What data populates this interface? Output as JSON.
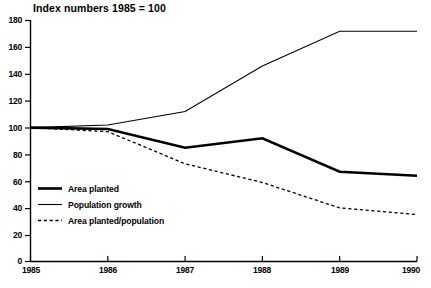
{
  "chart_data": {
    "type": "line",
    "title": "Index numbers 1985 = 100",
    "xlabel": "",
    "ylabel": "",
    "x": [
      1985,
      1986,
      1987,
      1988,
      1989,
      1990
    ],
    "xtick_labels": [
      "1985",
      "1986",
      "1987",
      "1988",
      "1989",
      "1990"
    ],
    "ytick_labels": [
      "0",
      "20",
      "40",
      "60",
      "80",
      "100",
      "120",
      "140",
      "160",
      "180"
    ],
    "yticks": [
      0,
      20,
      40,
      60,
      80,
      100,
      120,
      140,
      160,
      180
    ],
    "xlim": [
      1985,
      1990
    ],
    "ylim": [
      0,
      180
    ],
    "grid": false,
    "legend_position": "inside-lower-left",
    "series": [
      {
        "name": "Area planted",
        "style": "solid-thick",
        "color": "#000000",
        "values": [
          100,
          99,
          85,
          92,
          67,
          64
        ]
      },
      {
        "name": "Population growth",
        "style": "solid-thin",
        "color": "#000000",
        "values": [
          100,
          102,
          112,
          146,
          172,
          172
        ]
      },
      {
        "name": "Area planted/population",
        "style": "dashed",
        "color": "#000000",
        "values": [
          100,
          97,
          73,
          59,
          40,
          35
        ]
      }
    ]
  },
  "legend": {
    "items": [
      {
        "label": "Area planted"
      },
      {
        "label": "Population growth"
      },
      {
        "label": "Area planted/population"
      }
    ]
  },
  "axes": {
    "y_axis_name": "index-value-axis",
    "x_axis_name": "year-axis"
  }
}
